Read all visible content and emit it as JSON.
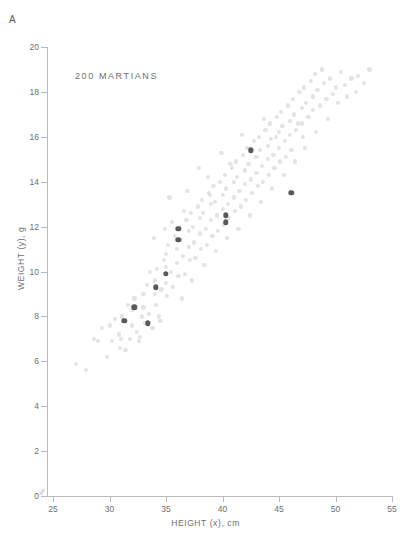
{
  "figure": {
    "panel_label": "A",
    "title": "200 MARTIANS"
  },
  "chart_data": {
    "type": "scatter",
    "title": "200 MARTIANS",
    "panel": "A",
    "xlabel": "HEIGHT (x), cm",
    "ylabel": "WEIGHT (y), g",
    "xlim": [
      25,
      55
    ],
    "ylim": [
      0,
      20
    ],
    "xticks": [
      25,
      30,
      35,
      40,
      45,
      50,
      55
    ],
    "yticks": [
      0,
      2,
      4,
      6,
      8,
      10,
      12,
      14,
      16,
      18,
      20
    ],
    "grid": false,
    "legend": null,
    "axis_break": "//",
    "n_points": 200,
    "colors": {
      "background_points": "#e3e3e4",
      "highlight_points": "#58595b",
      "axis": "#b9babc",
      "text": "#6d6e70"
    },
    "series": [
      {
        "name": "background",
        "color": "#e3e3e4",
        "points": [
          [
            27.0,
            5.9
          ],
          [
            27.9,
            5.6
          ],
          [
            28.6,
            7.0
          ],
          [
            29.0,
            6.9
          ],
          [
            29.8,
            6.2
          ],
          [
            30.0,
            7.6
          ],
          [
            30.2,
            6.9
          ],
          [
            30.8,
            7.2
          ],
          [
            30.9,
            6.6
          ],
          [
            31.0,
            7.0
          ],
          [
            31.1,
            8.0
          ],
          [
            31.4,
            6.5
          ],
          [
            31.8,
            7.0
          ],
          [
            32.0,
            7.6
          ],
          [
            32.0,
            8.3
          ],
          [
            32.2,
            8.8
          ],
          [
            32.4,
            7.3
          ],
          [
            32.6,
            6.9
          ],
          [
            32.9,
            8.0
          ],
          [
            33.0,
            9.0
          ],
          [
            33.0,
            8.4
          ],
          [
            33.1,
            7.7
          ],
          [
            33.3,
            9.4
          ],
          [
            33.5,
            8.1
          ],
          [
            33.8,
            7.5
          ],
          [
            34.0,
            9.6
          ],
          [
            34.0,
            9.0
          ],
          [
            34.1,
            8.5
          ],
          [
            34.2,
            10.1
          ],
          [
            34.4,
            8.0
          ],
          [
            34.6,
            9.2
          ],
          [
            34.8,
            10.5
          ],
          [
            35.0,
            10.8
          ],
          [
            35.0,
            10.2
          ],
          [
            35.0,
            9.5
          ],
          [
            35.1,
            8.9
          ],
          [
            35.2,
            11.2
          ],
          [
            35.4,
            10.0
          ],
          [
            35.6,
            9.3
          ],
          [
            35.8,
            11.6
          ],
          [
            36.0,
            11.0
          ],
          [
            36.0,
            10.4
          ],
          [
            36.1,
            9.8
          ],
          [
            36.2,
            12.0
          ],
          [
            36.3,
            11.4
          ],
          [
            36.5,
            10.7
          ],
          [
            36.7,
            9.9
          ],
          [
            36.8,
            12.3
          ],
          [
            37.0,
            11.8
          ],
          [
            37.0,
            11.1
          ],
          [
            37.1,
            10.5
          ],
          [
            37.2,
            12.6
          ],
          [
            37.4,
            12.0
          ],
          [
            37.5,
            11.3
          ],
          [
            37.6,
            10.6
          ],
          [
            37.8,
            12.9
          ],
          [
            38.0,
            12.4
          ],
          [
            38.0,
            11.7
          ],
          [
            38.1,
            11.0
          ],
          [
            38.2,
            13.2
          ],
          [
            38.3,
            12.6
          ],
          [
            38.5,
            11.9
          ],
          [
            38.6,
            11.2
          ],
          [
            38.8,
            13.5
          ],
          [
            39.0,
            13.0
          ],
          [
            39.0,
            12.3
          ],
          [
            39.1,
            11.6
          ],
          [
            39.2,
            13.8
          ],
          [
            39.3,
            13.1
          ],
          [
            39.5,
            12.5
          ],
          [
            39.6,
            11.8
          ],
          [
            39.8,
            14.0
          ],
          [
            40.0,
            13.4
          ],
          [
            40.0,
            12.8
          ],
          [
            40.1,
            12.1
          ],
          [
            40.2,
            14.3
          ],
          [
            40.3,
            13.7
          ],
          [
            40.5,
            13.0
          ],
          [
            40.6,
            12.4
          ],
          [
            40.8,
            14.6
          ],
          [
            41.0,
            14.0
          ],
          [
            41.0,
            13.3
          ],
          [
            41.1,
            12.7
          ],
          [
            41.2,
            14.9
          ],
          [
            41.3,
            14.2
          ],
          [
            41.5,
            13.6
          ],
          [
            41.6,
            12.9
          ],
          [
            41.8,
            15.2
          ],
          [
            42.0,
            14.5
          ],
          [
            42.0,
            13.9
          ],
          [
            42.1,
            13.2
          ],
          [
            42.2,
            15.5
          ],
          [
            42.3,
            14.8
          ],
          [
            42.5,
            14.1
          ],
          [
            42.6,
            13.5
          ],
          [
            42.8,
            15.8
          ],
          [
            43.0,
            15.1
          ],
          [
            43.0,
            14.4
          ],
          [
            43.1,
            13.8
          ],
          [
            43.2,
            16.0
          ],
          [
            43.3,
            15.4
          ],
          [
            43.5,
            14.7
          ],
          [
            43.6,
            14.0
          ],
          [
            43.8,
            16.3
          ],
          [
            44.0,
            15.6
          ],
          [
            44.0,
            15.0
          ],
          [
            44.1,
            14.3
          ],
          [
            44.2,
            16.6
          ],
          [
            44.3,
            15.9
          ],
          [
            44.5,
            15.2
          ],
          [
            44.6,
            14.6
          ],
          [
            44.8,
            16.9
          ],
          [
            45.0,
            16.2
          ],
          [
            45.0,
            15.5
          ],
          [
            45.1,
            14.9
          ],
          [
            45.2,
            17.1
          ],
          [
            45.3,
            16.5
          ],
          [
            45.5,
            15.8
          ],
          [
            45.6,
            15.1
          ],
          [
            45.8,
            17.4
          ],
          [
            46.0,
            16.7
          ],
          [
            46.0,
            16.1
          ],
          [
            46.1,
            15.4
          ],
          [
            46.2,
            17.7
          ],
          [
            46.3,
            17.0
          ],
          [
            46.5,
            16.3
          ],
          [
            46.8,
            18.0
          ],
          [
            47.0,
            17.3
          ],
          [
            47.0,
            16.6
          ],
          [
            47.1,
            16.0
          ],
          [
            47.2,
            18.2
          ],
          [
            47.4,
            17.5
          ],
          [
            47.6,
            16.9
          ],
          [
            47.8,
            18.5
          ],
          [
            48.0,
            17.8
          ],
          [
            48.0,
            17.2
          ],
          [
            48.2,
            18.8
          ],
          [
            48.4,
            18.1
          ],
          [
            48.6,
            17.4
          ],
          [
            48.8,
            19.0
          ],
          [
            49.0,
            18.4
          ],
          [
            49.2,
            17.7
          ],
          [
            49.5,
            18.6
          ],
          [
            49.8,
            17.9
          ],
          [
            50.0,
            18.2
          ],
          [
            50.2,
            17.5
          ],
          [
            50.5,
            18.9
          ],
          [
            50.8,
            18.3
          ],
          [
            51.0,
            17.8
          ],
          [
            51.4,
            18.6
          ],
          [
            51.8,
            18.0
          ],
          [
            52.0,
            18.7
          ],
          [
            52.5,
            18.4
          ],
          [
            53.0,
            19.0
          ],
          [
            29.3,
            7.5
          ],
          [
            30.5,
            7.9
          ],
          [
            31.6,
            8.5
          ],
          [
            32.7,
            7.1
          ],
          [
            33.6,
            10.0
          ],
          [
            34.5,
            7.8
          ],
          [
            35.5,
            12.2
          ],
          [
            36.4,
            8.8
          ],
          [
            37.3,
            9.6
          ],
          [
            38.4,
            10.3
          ],
          [
            39.4,
            10.9
          ],
          [
            40.4,
            11.5
          ],
          [
            41.4,
            11.9
          ],
          [
            42.4,
            12.5
          ],
          [
            43.4,
            13.1
          ],
          [
            44.4,
            13.7
          ],
          [
            45.4,
            14.3
          ],
          [
            46.4,
            14.9
          ],
          [
            47.3,
            15.5
          ],
          [
            48.3,
            16.2
          ],
          [
            49.3,
            16.8
          ],
          [
            35.3,
            13.3
          ],
          [
            36.9,
            13.6
          ],
          [
            38.7,
            14.2
          ],
          [
            40.7,
            14.8
          ],
          [
            42.7,
            15.4
          ],
          [
            44.7,
            16.0
          ],
          [
            46.7,
            16.6
          ],
          [
            33.9,
            11.5
          ],
          [
            34.9,
            11.9
          ],
          [
            36.6,
            12.7
          ],
          [
            38.9,
            13.4
          ],
          [
            41.7,
            16.1
          ],
          [
            43.7,
            16.8
          ],
          [
            39.9,
            15.3
          ],
          [
            37.9,
            14.6
          ]
        ]
      },
      {
        "name": "highlighted",
        "color": "#58595b",
        "points": [
          [
            31.3,
            7.8
          ],
          [
            32.2,
            8.4
          ],
          [
            33.4,
            7.7
          ],
          [
            34.1,
            9.3
          ],
          [
            35.0,
            9.9
          ],
          [
            36.1,
            11.4
          ],
          [
            36.1,
            11.9
          ],
          [
            40.3,
            12.2
          ],
          [
            40.3,
            12.5
          ],
          [
            42.5,
            15.4
          ],
          [
            46.1,
            13.5
          ]
        ]
      }
    ]
  },
  "axes": {
    "x": {
      "label": "HEIGHT (x), cm",
      "ticks": [
        "25",
        "30",
        "35",
        "40",
        "45",
        "50",
        "55"
      ]
    },
    "y": {
      "label": "WEIGHT (y), g",
      "ticks": [
        "0",
        "2",
        "4",
        "6",
        "8",
        "10",
        "12",
        "14",
        "16",
        "18",
        "20"
      ]
    },
    "break_marker": "//"
  }
}
